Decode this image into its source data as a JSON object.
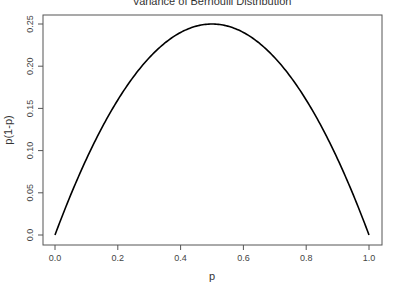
{
  "chart_data": {
    "type": "line",
    "title": "Variance of Bernoulli Distribution",
    "xlabel": "p",
    "ylabel": "p(1-p)",
    "xlim": [
      0,
      1
    ],
    "ylim": [
      0,
      0.25
    ],
    "grid": false,
    "legend": null,
    "x_ticks": [
      "0.0",
      "0.2",
      "0.4",
      "0.6",
      "0.8",
      "1.0"
    ],
    "y_ticks": [
      "0.0",
      "0.05",
      "0.10",
      "0.15",
      "0.20",
      "0.25"
    ],
    "series": [
      {
        "name": "p(1-p)",
        "color": "#000000",
        "x": [
          0.0,
          0.05,
          0.1,
          0.15,
          0.2,
          0.25,
          0.3,
          0.35,
          0.4,
          0.45,
          0.5,
          0.55,
          0.6,
          0.65,
          0.7,
          0.75,
          0.8,
          0.85,
          0.9,
          0.95,
          1.0
        ],
        "y": [
          0.0,
          0.0475,
          0.09,
          0.1275,
          0.16,
          0.1875,
          0.21,
          0.2275,
          0.24,
          0.2475,
          0.25,
          0.2475,
          0.24,
          0.2275,
          0.21,
          0.1875,
          0.16,
          0.1275,
          0.09,
          0.0475,
          0.0
        ]
      }
    ]
  }
}
